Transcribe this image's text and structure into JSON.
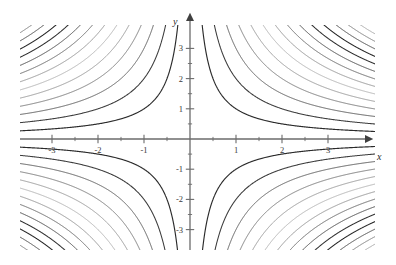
{
  "chart_data": {
    "type": "line",
    "title": "",
    "subtitle": "",
    "xlabel": "x",
    "ylabel": "y",
    "xlim": [
      -3.25,
      3.25
    ],
    "ylim": [
      -3.35,
      3.35
    ],
    "grid": false,
    "legend": "none",
    "axis_style": "arrows-both-ends-positive",
    "x_ticks_major": [
      -3,
      -2,
      -1,
      1,
      2,
      3
    ],
    "x_tick_labels": [
      "-3",
      "-2",
      "-1",
      "1",
      "2",
      "3"
    ],
    "y_ticks_major": [
      -3,
      -2,
      -1,
      1,
      2,
      3
    ],
    "y_tick_labels": [
      "-3",
      "-2",
      "-1",
      "1",
      "2",
      "3"
    ],
    "x_ticks_minor": [
      -2.5,
      -1.5,
      -0.5,
      0.5,
      1.5,
      2.5
    ],
    "y_ticks_minor": [
      -2.5,
      -1.5,
      -0.5,
      0.5,
      1.5,
      2.5
    ],
    "contour_equation": "x*y = c",
    "contour_levels": [
      {
        "c": 1.0,
        "shade": "#2b2b2b",
        "width": 1.15,
        "quadrants": "1,3"
      },
      {
        "c": 2.0,
        "shade": "#3b3b3b",
        "width": 1.05,
        "quadrants": "1,3"
      },
      {
        "c": 3.0,
        "shade": "#555555",
        "width": 0.95,
        "quadrants": "1,3"
      },
      {
        "c": 4.0,
        "shade": "#6e6e6e",
        "width": 0.9,
        "quadrants": "1,3"
      },
      {
        "c": 5.0,
        "shade": "#8a8a8a",
        "width": 0.85,
        "quadrants": "1,3"
      },
      {
        "c": 6.0,
        "shade": "#a8a8a8",
        "width": 0.85,
        "quadrants": "1,3"
      },
      {
        "c": 7.0,
        "shade": "#8a8a8a",
        "width": 0.9,
        "quadrants": "1,3"
      },
      {
        "c": 8.0,
        "shade": "#606060",
        "width": 0.95,
        "quadrants": "1,3"
      },
      {
        "c": 9.0,
        "shade": "#454545",
        "width": 1.0,
        "quadrants": "1,3"
      },
      {
        "c": 10.0,
        "shade": "#2f2f2f",
        "width": 1.05,
        "quadrants": "1,3"
      },
      {
        "c": 11.0,
        "shade": "#242424",
        "width": 1.05,
        "quadrants": "1,3"
      },
      {
        "c": 12.0,
        "shade": "#3d3d3d",
        "width": 0.95,
        "quadrants": "1,3"
      },
      {
        "c": 13.0,
        "shade": "#707070",
        "width": 0.9,
        "quadrants": "1,3"
      },
      {
        "c": 14.0,
        "shade": "#9a9a9a",
        "width": 0.85,
        "quadrants": "1,3"
      },
      {
        "c": -1.0,
        "shade": "#2b2b2b",
        "width": 1.15,
        "quadrants": "2,4"
      },
      {
        "c": -2.0,
        "shade": "#3b3b3b",
        "width": 1.05,
        "quadrants": "2,4"
      },
      {
        "c": -3.0,
        "shade": "#555555",
        "width": 0.95,
        "quadrants": "2,4"
      },
      {
        "c": -4.0,
        "shade": "#6e6e6e",
        "width": 0.9,
        "quadrants": "2,4"
      },
      {
        "c": -5.0,
        "shade": "#8a8a8a",
        "width": 0.85,
        "quadrants": "2,4"
      },
      {
        "c": -6.0,
        "shade": "#a8a8a8",
        "width": 0.85,
        "quadrants": "2,4"
      },
      {
        "c": -7.0,
        "shade": "#8a8a8a",
        "width": 0.9,
        "quadrants": "2,4"
      },
      {
        "c": -8.0,
        "shade": "#606060",
        "width": 0.95,
        "quadrants": "2,4"
      },
      {
        "c": -9.0,
        "shade": "#454545",
        "width": 1.0,
        "quadrants": "2,4"
      },
      {
        "c": -10.0,
        "shade": "#2f2f2f",
        "width": 1.05,
        "quadrants": "2,4"
      },
      {
        "c": -11.0,
        "shade": "#242424",
        "width": 1.05,
        "quadrants": "2,4"
      },
      {
        "c": -12.0,
        "shade": "#3d3d3d",
        "width": 0.95,
        "quadrants": "2,4"
      },
      {
        "c": -13.0,
        "shade": "#707070",
        "width": 0.9,
        "quadrants": "2,4"
      },
      {
        "c": -14.0,
        "shade": "#9a9a9a",
        "width": 0.85,
        "quadrants": "2,4"
      }
    ],
    "colors": {
      "axis": "#6b6b6b",
      "curve_dark": "#2b2b2b",
      "curve_mid": "#6e6e6e",
      "curve_light": "#a8a8a8",
      "background": "#ffffff",
      "text": "#3a3a3a"
    }
  },
  "geometry": {
    "origin_px": {
      "x": 190,
      "y": 139
    },
    "unit_px": {
      "x": 46,
      "y": 30.2
    },
    "plot_box_px": {
      "left": 20,
      "top": 25,
      "right": 375,
      "bottom": 250
    }
  },
  "labels": {
    "x_axis": "x",
    "y_axis": "y"
  }
}
